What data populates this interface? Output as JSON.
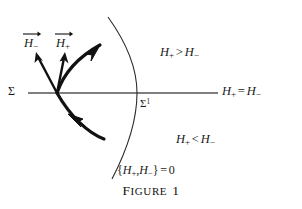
{
  "figure": {
    "caption": "FIGURE 1",
    "caption_word": "IGURE",
    "caption_first_letter": "F",
    "caption_number": "1",
    "background_color": "#ffffff",
    "ink_color": "#1a1a1a",
    "axis_color": "#555555"
  },
  "axis": {
    "left_label": "Σ",
    "intersection_label_base": "Σ",
    "intersection_label_sup": "1",
    "right_label": {
      "lhs": "H",
      "lhs_sub": "+",
      "operator": "=",
      "rhs": "H",
      "rhs_sub": "−"
    }
  },
  "regions": [
    {
      "name": "upper-region",
      "lhs": "H",
      "lhs_sub": "+",
      "operator": ">",
      "rhs": "H",
      "rhs_sub": "−"
    },
    {
      "name": "lower-region",
      "lhs": "H",
      "lhs_sub": "+",
      "operator": "<",
      "rhs": "H",
      "rhs_sub": "−"
    }
  ],
  "curve": {
    "label_open": "{",
    "label_lhs": "H",
    "label_lhs_sub": "+",
    "label_comma": ",",
    "label_rhs": "H",
    "label_rhs_sub": "−",
    "label_close": "}",
    "label_operator": "=",
    "label_value": "0"
  },
  "vectors": [
    {
      "name": "vector-h-minus",
      "symbol": "H",
      "subscript": "−"
    },
    {
      "name": "vector-h-plus",
      "symbol": "H",
      "subscript": "+"
    }
  ]
}
